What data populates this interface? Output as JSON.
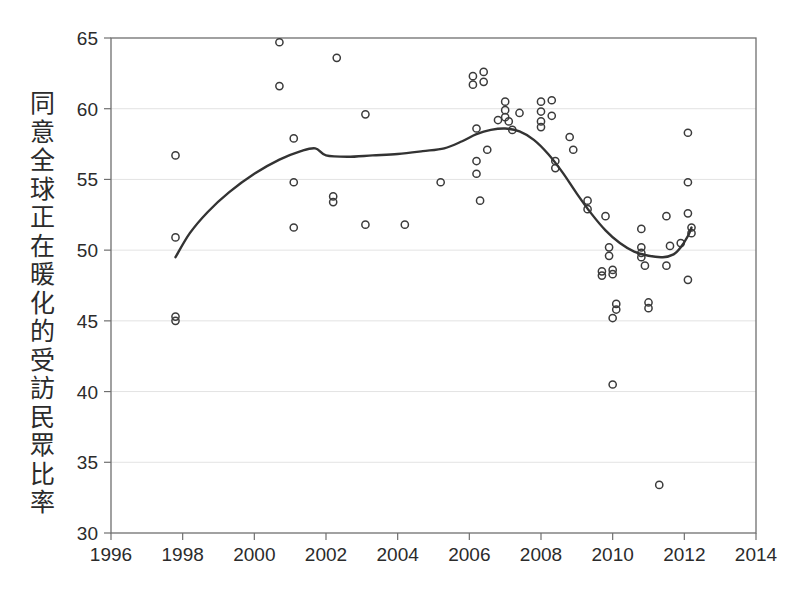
{
  "chart_data": {
    "type": "scatter",
    "title": "",
    "subtitle": "",
    "xlabel": "",
    "ylabel": "同意全球正在暖化的受訪民眾比率",
    "xlim": [
      1996,
      2014
    ],
    "ylim": [
      30,
      65
    ],
    "xticks": [
      1996,
      1998,
      2000,
      2002,
      2004,
      2006,
      2008,
      2010,
      2012,
      2014
    ],
    "yticks": [
      30,
      35,
      40,
      45,
      50,
      55,
      60,
      65
    ],
    "grid": "horizontal",
    "legend": "none",
    "marker": "open-circle",
    "point_color": "#3b3b3b",
    "line_color": "#333333",
    "grid_color": "#e3e3e3",
    "frame_color": "#6f6f6f",
    "background_color": "#ffffff",
    "points": [
      {
        "x": 1997.8,
        "y": 56.7
      },
      {
        "x": 1997.8,
        "y": 50.9
      },
      {
        "x": 1997.8,
        "y": 45.3
      },
      {
        "x": 1997.8,
        "y": 45.0
      },
      {
        "x": 2000.7,
        "y": 64.7
      },
      {
        "x": 2000.7,
        "y": 61.6
      },
      {
        "x": 2001.1,
        "y": 57.9
      },
      {
        "x": 2001.1,
        "y": 54.8
      },
      {
        "x": 2001.1,
        "y": 51.6
      },
      {
        "x": 2002.3,
        "y": 63.6
      },
      {
        "x": 2002.2,
        "y": 53.8
      },
      {
        "x": 2002.2,
        "y": 53.4
      },
      {
        "x": 2003.1,
        "y": 59.6
      },
      {
        "x": 2003.1,
        "y": 51.8
      },
      {
        "x": 2004.2,
        "y": 51.8
      },
      {
        "x": 2005.2,
        "y": 54.8
      },
      {
        "x": 2006.1,
        "y": 62.3
      },
      {
        "x": 2006.1,
        "y": 61.7
      },
      {
        "x": 2006.4,
        "y": 62.6
      },
      {
        "x": 2006.4,
        "y": 61.9
      },
      {
        "x": 2006.2,
        "y": 58.6
      },
      {
        "x": 2006.2,
        "y": 56.3
      },
      {
        "x": 2006.2,
        "y": 55.4
      },
      {
        "x": 2006.3,
        "y": 53.5
      },
      {
        "x": 2006.5,
        "y": 57.1
      },
      {
        "x": 2006.8,
        "y": 59.2
      },
      {
        "x": 2007.0,
        "y": 60.5
      },
      {
        "x": 2007.0,
        "y": 59.9
      },
      {
        "x": 2007.0,
        "y": 59.4
      },
      {
        "x": 2007.1,
        "y": 59.1
      },
      {
        "x": 2007.2,
        "y": 58.5
      },
      {
        "x": 2007.4,
        "y": 59.7
      },
      {
        "x": 2008.0,
        "y": 60.5
      },
      {
        "x": 2008.0,
        "y": 59.8
      },
      {
        "x": 2008.0,
        "y": 59.1
      },
      {
        "x": 2008.0,
        "y": 58.7
      },
      {
        "x": 2008.3,
        "y": 60.6
      },
      {
        "x": 2008.3,
        "y": 59.5
      },
      {
        "x": 2008.4,
        "y": 56.3
      },
      {
        "x": 2008.4,
        "y": 55.8
      },
      {
        "x": 2008.8,
        "y": 58.0
      },
      {
        "x": 2008.9,
        "y": 57.1
      },
      {
        "x": 2009.3,
        "y": 53.5
      },
      {
        "x": 2009.3,
        "y": 52.9
      },
      {
        "x": 2009.8,
        "y": 52.4
      },
      {
        "x": 2009.9,
        "y": 50.2
      },
      {
        "x": 2009.9,
        "y": 49.6
      },
      {
        "x": 2010.0,
        "y": 48.6
      },
      {
        "x": 2010.0,
        "y": 48.3
      },
      {
        "x": 2009.7,
        "y": 48.5
      },
      {
        "x": 2009.7,
        "y": 48.2
      },
      {
        "x": 2010.1,
        "y": 46.2
      },
      {
        "x": 2010.1,
        "y": 45.8
      },
      {
        "x": 2010.0,
        "y": 45.2
      },
      {
        "x": 2010.0,
        "y": 40.5
      },
      {
        "x": 2010.8,
        "y": 51.5
      },
      {
        "x": 2010.8,
        "y": 50.2
      },
      {
        "x": 2010.8,
        "y": 49.8
      },
      {
        "x": 2010.8,
        "y": 49.5
      },
      {
        "x": 2010.9,
        "y": 48.9
      },
      {
        "x": 2011.0,
        "y": 46.3
      },
      {
        "x": 2011.0,
        "y": 45.9
      },
      {
        "x": 2011.3,
        "y": 33.4
      },
      {
        "x": 2011.5,
        "y": 52.4
      },
      {
        "x": 2011.5,
        "y": 48.9
      },
      {
        "x": 2011.6,
        "y": 50.3
      },
      {
        "x": 2012.1,
        "y": 58.3
      },
      {
        "x": 2012.1,
        "y": 54.8
      },
      {
        "x": 2012.1,
        "y": 52.6
      },
      {
        "x": 2012.2,
        "y": 51.6
      },
      {
        "x": 2012.2,
        "y": 51.2
      },
      {
        "x": 2012.1,
        "y": 47.9
      },
      {
        "x": 2011.9,
        "y": 50.5
      }
    ],
    "trend": [
      {
        "x": 1997.8,
        "y": 49.5
      },
      {
        "x": 1998.2,
        "y": 51.2
      },
      {
        "x": 1998.7,
        "y": 52.7
      },
      {
        "x": 1999.3,
        "y": 54.1
      },
      {
        "x": 2000.0,
        "y": 55.4
      },
      {
        "x": 2000.7,
        "y": 56.4
      },
      {
        "x": 2001.3,
        "y": 57.0
      },
      {
        "x": 2001.7,
        "y": 57.2
      },
      {
        "x": 2002.0,
        "y": 56.7
      },
      {
        "x": 2002.6,
        "y": 56.6
      },
      {
        "x": 2003.3,
        "y": 56.7
      },
      {
        "x": 2004.0,
        "y": 56.8
      },
      {
        "x": 2004.7,
        "y": 57.0
      },
      {
        "x": 2005.3,
        "y": 57.2
      },
      {
        "x": 2005.8,
        "y": 57.7
      },
      {
        "x": 2006.2,
        "y": 58.2
      },
      {
        "x": 2006.6,
        "y": 58.5
      },
      {
        "x": 2007.0,
        "y": 58.6
      },
      {
        "x": 2007.4,
        "y": 58.4
      },
      {
        "x": 2007.8,
        "y": 57.8
      },
      {
        "x": 2008.2,
        "y": 56.8
      },
      {
        "x": 2008.6,
        "y": 55.5
      },
      {
        "x": 2009.0,
        "y": 54.0
      },
      {
        "x": 2009.4,
        "y": 52.6
      },
      {
        "x": 2009.8,
        "y": 51.4
      },
      {
        "x": 2010.2,
        "y": 50.5
      },
      {
        "x": 2010.6,
        "y": 49.9
      },
      {
        "x": 2011.0,
        "y": 49.6
      },
      {
        "x": 2011.4,
        "y": 49.5
      },
      {
        "x": 2011.7,
        "y": 49.7
      },
      {
        "x": 2011.9,
        "y": 50.2
      },
      {
        "x": 2012.1,
        "y": 51.0
      },
      {
        "x": 2012.2,
        "y": 51.6
      }
    ]
  },
  "axes": {
    "y_label_text": "同意全球正在暖化的受訪民眾比率",
    "x_tick_labels": [
      "1996",
      "1998",
      "2000",
      "2002",
      "2004",
      "2006",
      "2008",
      "2010",
      "2012",
      "2014"
    ],
    "y_tick_labels": [
      "65",
      "60",
      "55",
      "50",
      "45",
      "40",
      "35",
      "30"
    ]
  }
}
